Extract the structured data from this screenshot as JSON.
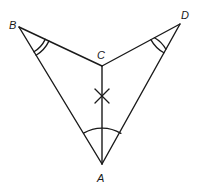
{
  "diagram": {
    "type": "geometry-figure",
    "points": {
      "A": {
        "label": "A",
        "x": 102,
        "y": 164,
        "label_x": 98,
        "label_y": 181
      },
      "B": {
        "label": "B",
        "x": 19,
        "y": 27,
        "label_x": 9,
        "label_y": 27
      },
      "C": {
        "label": "C",
        "x": 102,
        "y": 66,
        "label_x": 97,
        "label_y": 58
      },
      "D": {
        "label": "D",
        "x": 180,
        "y": 24,
        "label_x": 181,
        "label_y": 18
      }
    },
    "segments": [
      {
        "from": "B",
        "to": "C"
      },
      {
        "from": "C",
        "to": "D"
      },
      {
        "from": "B",
        "to": "A"
      },
      {
        "from": "D",
        "to": "A"
      },
      {
        "from": "C",
        "to": "A"
      }
    ],
    "angle_marks": [
      {
        "vertex": "B",
        "arcs": 2,
        "meaning": "angle ABC congruent to angle CDA"
      },
      {
        "vertex": "D",
        "arcs": 2,
        "meaning": "angle CDA congruent to angle ABC"
      },
      {
        "vertex": "A",
        "arcs": 1,
        "meaning": "angle BAD (bisected by AC)"
      }
    ],
    "tick_marks": [
      {
        "segment": "CA",
        "style": "X",
        "note": "cross mark on segment CA"
      }
    ],
    "stroke_color": "#1a1a1a",
    "background": "#ffffff"
  }
}
